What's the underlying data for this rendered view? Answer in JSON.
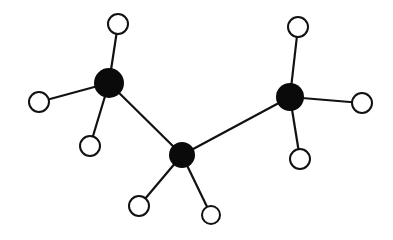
{
  "diagram": {
    "title": "",
    "background": "#ffffff",
    "bond_color": "#111111",
    "carbon_color": "#0a0a0a",
    "hydrogen_fill": "#ffffff",
    "hydrogen_stroke": "#111111",
    "atoms": [
      {
        "id": "C1",
        "element": "C",
        "x": 109,
        "y": 83,
        "r": 15
      },
      {
        "id": "C2",
        "element": "C",
        "x": 182,
        "y": 155,
        "r": 13
      },
      {
        "id": "C3",
        "element": "C",
        "x": 290,
        "y": 97,
        "r": 14
      },
      {
        "id": "H1",
        "element": "H",
        "x": 118,
        "y": 24,
        "r": 10
      },
      {
        "id": "H2",
        "element": "H",
        "x": 39,
        "y": 102,
        "r": 10
      },
      {
        "id": "H3",
        "element": "H",
        "x": 90,
        "y": 146,
        "r": 10
      },
      {
        "id": "H4",
        "element": "H",
        "x": 139,
        "y": 206,
        "r": 10
      },
      {
        "id": "H5",
        "element": "H",
        "x": 211,
        "y": 215,
        "r": 9
      },
      {
        "id": "H6",
        "element": "H",
        "x": 298,
        "y": 27,
        "r": 10
      },
      {
        "id": "H7",
        "element": "H",
        "x": 362,
        "y": 103,
        "r": 10
      },
      {
        "id": "H8",
        "element": "H",
        "x": 300,
        "y": 159,
        "r": 10
      }
    ],
    "bonds": [
      [
        "C1",
        "C2"
      ],
      [
        "C2",
        "C3"
      ],
      [
        "C1",
        "H1"
      ],
      [
        "C1",
        "H2"
      ],
      [
        "C1",
        "H3"
      ],
      [
        "C2",
        "H4"
      ],
      [
        "C2",
        "H5"
      ],
      [
        "C3",
        "H6"
      ],
      [
        "C3",
        "H7"
      ],
      [
        "C3",
        "H8"
      ]
    ]
  }
}
